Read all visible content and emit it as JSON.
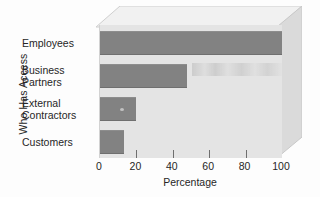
{
  "chart_data": {
    "type": "bar",
    "orientation": "horizontal",
    "title": "",
    "xlabel": "Percentage",
    "ylabel": "Who Has Access",
    "categories": [
      "Employees",
      "Business Partners",
      "External Contractors",
      "Customers"
    ],
    "values": [
      100,
      48,
      20,
      13
    ],
    "xlim": [
      0,
      100
    ],
    "xticks": [
      0,
      20,
      40,
      60,
      80,
      100
    ],
    "xticklabels": [
      "0",
      "20",
      "40",
      "60",
      "80",
      "100"
    ],
    "grid": false,
    "legend": null,
    "style": {
      "bar_color": "#828282",
      "plot_background": "#e4e4e4",
      "page_background": "#fdfdfd",
      "three_d_top_face": "#f0f0f0",
      "three_d_right_face": "#d8d8d8",
      "text_color": "#262626"
    }
  },
  "labels": {
    "y_axis_title": "Who Has Access",
    "x_axis_title": "Percentage",
    "categories": [
      {
        "line1": "Employees",
        "line2": ""
      },
      {
        "line1": "Business",
        "line2": "Partners"
      },
      {
        "line1": "External",
        "line2": "Contractors"
      },
      {
        "line1": "Customers",
        "line2": ""
      }
    ],
    "xticklabels": [
      "0",
      "20",
      "40",
      "60",
      "80",
      "100"
    ]
  }
}
